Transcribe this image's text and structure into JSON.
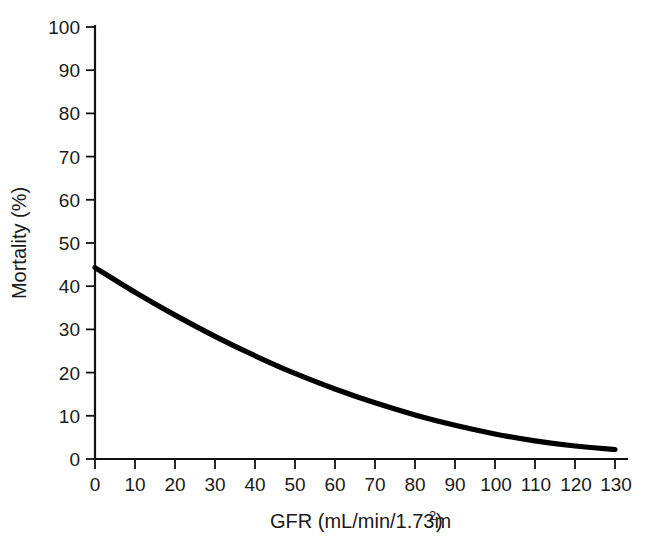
{
  "chart_data": {
    "type": "line",
    "title": "",
    "xlabel": "GFR (mL/min/1.73m2)",
    "xlabel_base": "GFR (mL/min/1.73m",
    "xlabel_sup": "2",
    "xlabel_tail": ")",
    "ylabel": "Mortality (%)",
    "xlim": [
      0,
      130
    ],
    "ylim": [
      0,
      100
    ],
    "grid": false,
    "legend": null,
    "xticks": [
      0,
      10,
      20,
      30,
      40,
      50,
      60,
      70,
      80,
      90,
      100,
      110,
      120,
      130
    ],
    "yticks": [
      0,
      10,
      20,
      30,
      40,
      50,
      60,
      70,
      80,
      90,
      100
    ],
    "series": [
      {
        "name": "Mortality vs GFR",
        "color": "#000000",
        "x": [
          0,
          10,
          20,
          30,
          40,
          50,
          60,
          70,
          80,
          90,
          100,
          110,
          120,
          130
        ],
        "y": [
          44.3,
          38.6,
          33.3,
          28.4,
          23.9,
          19.8,
          16.2,
          13.0,
          10.2,
          7.8,
          5.8,
          4.2,
          3.0,
          2.2
        ]
      }
    ]
  },
  "axes": {
    "y_title": "Mortality (%)",
    "x_title_base": "GFR (mL/min/1.73m",
    "x_title_sup": "2",
    "x_title_tail": ")",
    "ytick_labels": [
      "0",
      "10",
      "20",
      "30",
      "40",
      "50",
      "60",
      "70",
      "80",
      "90",
      "100"
    ],
    "xtick_labels": [
      "0",
      "10",
      "20",
      "30",
      "40",
      "50",
      "60",
      "70",
      "80",
      "90",
      "100",
      "110",
      "120",
      "130"
    ]
  },
  "colors": {
    "background": "#ffffff",
    "axis": "#111111",
    "curve": "#000000",
    "text": "#1a1a1a"
  }
}
